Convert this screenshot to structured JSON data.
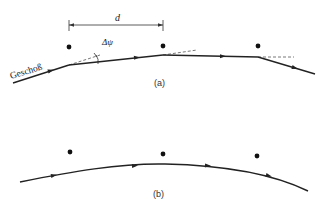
{
  "figure": {
    "panel_a": {
      "label": "(a)",
      "projectile_label": "Geschoß",
      "spacing_label": "d",
      "angle_label": "Δψ"
    },
    "panel_b": {
      "label": "(b)"
    }
  },
  "colors": {
    "line": "#222222",
    "dashed": "#555555",
    "dot": "#111111",
    "background": "#ffffff"
  }
}
